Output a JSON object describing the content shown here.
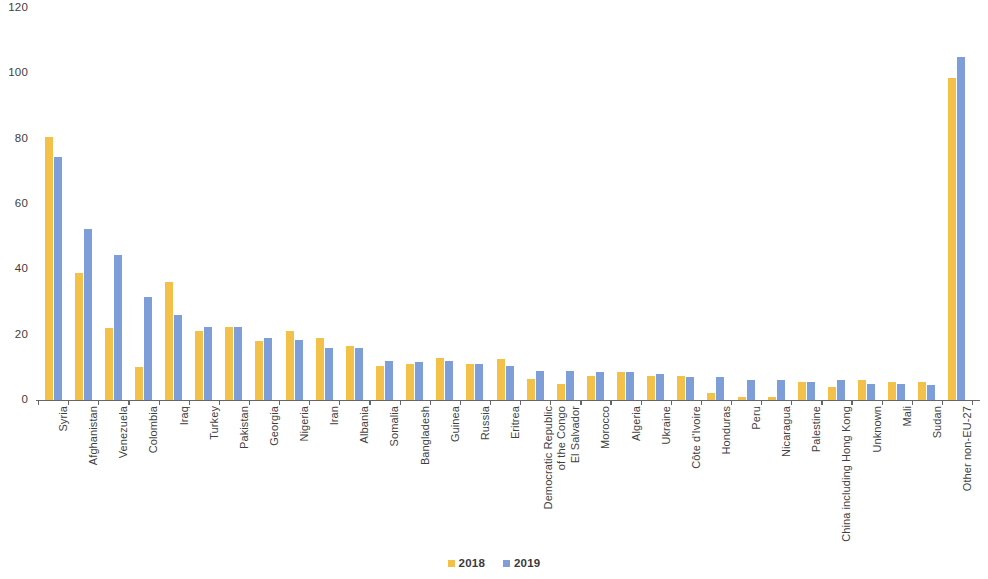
{
  "chart_data": {
    "type": "bar",
    "title": "",
    "subtitle": "",
    "xlabel": "",
    "ylabel": "",
    "ylim": [
      0,
      120
    ],
    "ytick_step": 20,
    "yticks": [
      "0",
      "20",
      "40",
      "60",
      "80",
      "100",
      "120"
    ],
    "grid": false,
    "legend_position": "bottom-center",
    "bar_gap_note": "grouped bars, 2018 left, 2019 right",
    "categories": [
      "Syria",
      "Afghanistan",
      "Venezuela",
      "Colombia",
      "Iraq",
      "Turkey",
      "Pakistan",
      "Georgia",
      "Nigeria",
      "Iran",
      "Albania",
      "Somalia",
      "Bangladesh",
      "Guinea",
      "Russia",
      "Eritrea",
      "Democratic Republic\nof the Congo",
      "El Salvador",
      "Morocco",
      "Algeria",
      "Ukraine",
      "Côte d'Ivoire",
      "Honduras",
      "Peru",
      "Nicaragua",
      "Palestine",
      "China including Hong Kong",
      "Unknown",
      "Mali",
      "Sudan",
      "Other non-EU-27"
    ],
    "series": [
      {
        "name": "2018",
        "color": "#f3c14a",
        "values": [
          80.5,
          39.0,
          22.0,
          10.0,
          36.0,
          21.0,
          22.5,
          18.0,
          21.0,
          19.0,
          16.5,
          10.5,
          11.0,
          13.0,
          11.0,
          12.5,
          6.5,
          5.0,
          7.5,
          8.5,
          7.5,
          7.5,
          2.0,
          1.0,
          1.0,
          5.5,
          4.0,
          6.0,
          5.5,
          5.5,
          98.5
        ]
      },
      {
        "name": "2019",
        "color": "#7e9ed9",
        "values": [
          74.5,
          52.5,
          44.5,
          31.5,
          26.0,
          22.5,
          22.5,
          19.0,
          18.5,
          16.0,
          16.0,
          12.0,
          11.5,
          12.0,
          11.0,
          10.5,
          9.0,
          9.0,
          8.5,
          8.5,
          8.0,
          7.0,
          7.0,
          6.0,
          6.0,
          5.5,
          6.0,
          5.0,
          5.0,
          4.5,
          105.0
        ]
      }
    ],
    "legend": [
      {
        "label": "2018",
        "color": "#f3c14a"
      },
      {
        "label": "2019",
        "color": "#7e9ed9"
      }
    ]
  },
  "axis": {
    "tick_color": "#666666",
    "label_color": "#404040"
  }
}
